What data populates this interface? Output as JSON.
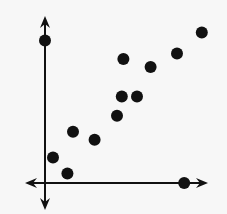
{
  "chart_data": {
    "type": "scatter",
    "title": "",
    "xlabel": "",
    "ylabel": "",
    "grid": false,
    "legend": null,
    "axes_style": "arrow-axes, no ticks or labels",
    "xlim": [
      -1.3,
      10.3
    ],
    "ylim": [
      -1.3,
      10.3
    ],
    "series": [
      {
        "name": "points",
        "color": "#111111",
        "points": [
          {
            "x": 0.0,
            "y": 8.9
          },
          {
            "x": 0.5,
            "y": 1.6
          },
          {
            "x": 1.4,
            "y": 0.6
          },
          {
            "x": 1.75,
            "y": 3.2
          },
          {
            "x": 3.1,
            "y": 2.7
          },
          {
            "x": 4.5,
            "y": 4.2
          },
          {
            "x": 4.8,
            "y": 5.4
          },
          {
            "x": 5.75,
            "y": 5.4
          },
          {
            "x": 4.9,
            "y": 7.75
          },
          {
            "x": 6.6,
            "y": 7.25
          },
          {
            "x": 8.25,
            "y": 8.1
          },
          {
            "x": 9.8,
            "y": 9.4
          },
          {
            "x": 8.7,
            "y": 0.0
          }
        ]
      }
    ]
  },
  "layout": {
    "origin_px": [
      45,
      183
    ],
    "unit_px": 16,
    "point_radius": 6,
    "axis_color": "#111111",
    "x_axis_px": [
      25,
      208
    ],
    "y_axis_px": [
      16,
      210
    ]
  }
}
